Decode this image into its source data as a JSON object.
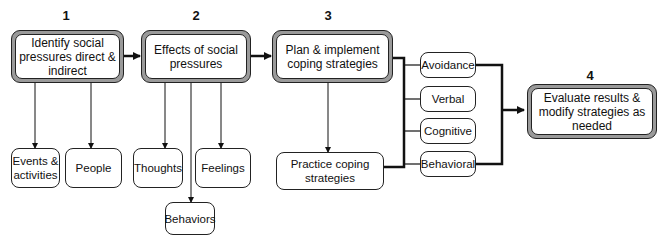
{
  "steps": [
    {
      "number": "1",
      "label": "Identify social pressures direct & indirect"
    },
    {
      "number": "2",
      "label": "Effects of social pressures"
    },
    {
      "number": "3",
      "label": "Plan & implement coping strategies"
    },
    {
      "number": "4",
      "label": "Evaluate results & modify strategies as needed"
    }
  ],
  "step1_children": [
    "Events & activities",
    "People"
  ],
  "step2_children": [
    "Thoughts",
    "Feelings",
    "Behaviors"
  ],
  "step3_practice": "Practice coping strategies",
  "strategies": [
    "Avoidance",
    "Verbal",
    "Cognitive",
    "Behavioral"
  ],
  "colors": {
    "line": "#111111",
    "frame": "#9a9a9a",
    "fill": "#ffffff"
  }
}
